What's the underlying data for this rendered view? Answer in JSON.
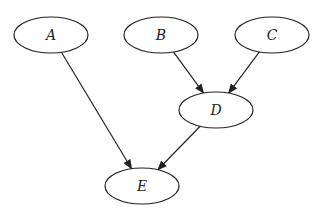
{
  "diagram": {
    "type": "directed-graph",
    "nodes": [
      {
        "id": "A",
        "label": "A",
        "cx": 51,
        "cy": 35
      },
      {
        "id": "B",
        "label": "B",
        "cx": 161,
        "cy": 35
      },
      {
        "id": "C",
        "label": "C",
        "cx": 272,
        "cy": 35
      },
      {
        "id": "D",
        "label": "D",
        "cx": 216,
        "cy": 110
      },
      {
        "id": "E",
        "label": "E",
        "cx": 142,
        "cy": 186
      }
    ],
    "edges": [
      {
        "from": "A",
        "to": "E"
      },
      {
        "from": "B",
        "to": "D"
      },
      {
        "from": "C",
        "to": "D"
      },
      {
        "from": "D",
        "to": "E"
      }
    ]
  }
}
